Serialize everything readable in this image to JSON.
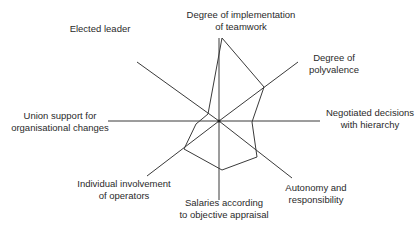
{
  "chart_data": {
    "type": "radar",
    "title": "",
    "center": [
      219,
      121
    ],
    "axes": [
      {
        "id": "teamwork",
        "label_lines": [
          "Degree of implementation",
          "of teamwork"
        ],
        "end": [
          219,
          38
        ],
        "value_point": [
          222,
          38
        ]
      },
      {
        "id": "polyvalence",
        "label_lines": [
          "Degree of",
          "polyvalence"
        ],
        "end": [
          298,
          62
        ],
        "value_point": [
          264,
          87
        ]
      },
      {
        "id": "negotiated",
        "label_lines": [
          "Negotiated decisions",
          "with hierarchy"
        ],
        "end": [
          320,
          121
        ],
        "value_point": [
          252,
          122
        ]
      },
      {
        "id": "autonomy",
        "label_lines": [
          "Autonomy and",
          "responsibility"
        ],
        "end": [
          292,
          178
        ],
        "value_point": [
          257,
          157
        ]
      },
      {
        "id": "salaries",
        "label_lines": [
          "Salaries according",
          "to objective appraisal"
        ],
        "end": [
          219,
          200
        ],
        "value_point": [
          222,
          170
        ]
      },
      {
        "id": "involvement",
        "label_lines": [
          "Individual involvement",
          "of operators"
        ],
        "end": [
          147,
          176
        ],
        "value_point": [
          184,
          149
        ]
      },
      {
        "id": "union",
        "label_lines": [
          "Union support for",
          "organisational changes"
        ],
        "end": [
          108,
          121
        ],
        "value_point": [
          196,
          124
        ]
      },
      {
        "id": "leader",
        "label_lines": [
          "Elected leader"
        ],
        "end": [
          137,
          62
        ],
        "value_point": [
          208,
          114
        ]
      }
    ],
    "relative_values": {
      "teamwork": 1.0,
      "polyvalence": 0.55,
      "negotiated": 0.33,
      "autonomy": 0.5,
      "salaries": 0.62,
      "involvement": 0.5,
      "union": 0.21,
      "leader": 0.13
    },
    "grid": false,
    "legend": null
  },
  "colors": {
    "line": "#3a3a3a",
    "text": "#2a2a2a",
    "background": "#ffffff"
  }
}
